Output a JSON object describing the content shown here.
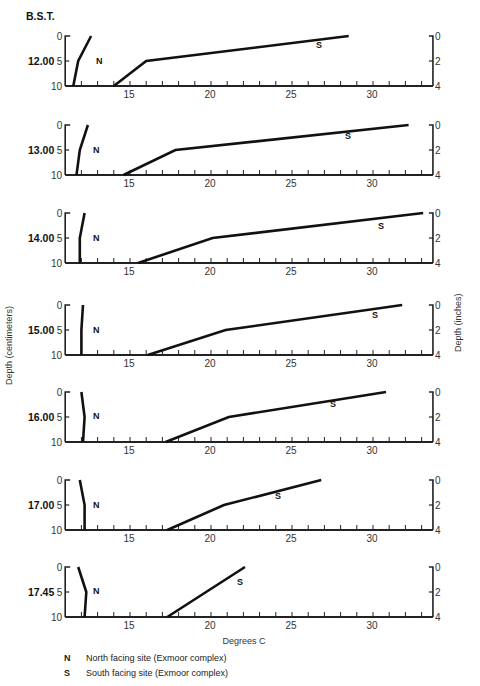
{
  "chart_data": {
    "type": "line",
    "title": "",
    "header_label": "B.S.T.",
    "xlabel": "Degrees C",
    "ylabel_left": "Depth (centimeters)",
    "ylabel_right": "Depth (inches)",
    "x_range": [
      11,
      33.7
    ],
    "x_ticks": [
      15,
      20,
      25,
      30
    ],
    "y_left_ticks": [
      0,
      5,
      10
    ],
    "y_right_ticks": [
      0,
      2,
      4
    ],
    "depth_cm": [
      0,
      5,
      10
    ],
    "grid": false,
    "legend_position": "bottom-left",
    "legend": [
      {
        "key": "N",
        "label": "North facing site (Exmoor complex)"
      },
      {
        "key": "S",
        "label": "South facing site (Exmoor complex)"
      }
    ],
    "panels": [
      {
        "time": "12.00",
        "series": [
          {
            "name": "N",
            "temps": [
              12.6,
              11.8,
              11.5
            ]
          },
          {
            "name": "S",
            "temps": [
              28.5,
              16.0,
              14.0
            ]
          }
        ]
      },
      {
        "time": "13.00",
        "series": [
          {
            "name": "N",
            "temps": [
              12.4,
              11.9,
              11.7
            ]
          },
          {
            "name": "S",
            "temps": [
              32.2,
              17.8,
              14.6
            ]
          }
        ]
      },
      {
        "time": "14.00",
        "series": [
          {
            "name": "N",
            "temps": [
              12.2,
              11.9,
              11.9
            ]
          },
          {
            "name": "S",
            "temps": [
              33.1,
              20.1,
              15.5
            ]
          }
        ]
      },
      {
        "time": "15.00",
        "series": [
          {
            "name": "N",
            "temps": [
              12.1,
              12.0,
              12.0
            ]
          },
          {
            "name": "S",
            "temps": [
              31.8,
              20.9,
              16.1
            ]
          }
        ]
      },
      {
        "time": "16.00",
        "series": [
          {
            "name": "N",
            "temps": [
              12.0,
              12.2,
              12.1
            ]
          },
          {
            "name": "S",
            "temps": [
              30.8,
              21.1,
              17.2
            ]
          }
        ]
      },
      {
        "time": "17.00",
        "series": [
          {
            "name": "N",
            "temps": [
              11.9,
              12.2,
              12.2
            ]
          },
          {
            "name": "S",
            "temps": [
              26.8,
              20.8,
              17.3
            ]
          }
        ]
      },
      {
        "time": "17.45",
        "series": [
          {
            "name": "N",
            "temps": [
              11.8,
              12.3,
              12.2
            ]
          },
          {
            "name": "S",
            "temps": [
              22.1,
              19.7,
              17.3
            ]
          }
        ]
      }
    ]
  },
  "layout": {
    "panel_tops": [
      36,
      125,
      213,
      305,
      392,
      480,
      567
    ],
    "panel_height": 50,
    "series_label_pos": {
      "N": [
        [
          96,
          64
        ],
        [
          93,
          153
        ],
        [
          93,
          241
        ],
        [
          93,
          333
        ],
        [
          93,
          419
        ],
        [
          93,
          508
        ],
        [
          93,
          594
        ]
      ],
      "S": [
        [
          316,
          48
        ],
        [
          345,
          139
        ],
        [
          378,
          229
        ],
        [
          372,
          318
        ],
        [
          330,
          407
        ],
        [
          275,
          499
        ],
        [
          237,
          585
        ]
      ]
    },
    "colors": {
      "line": "#111111",
      "axis": "#222222",
      "text": "#222222"
    }
  }
}
